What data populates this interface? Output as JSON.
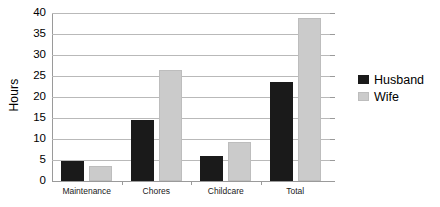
{
  "chart_data": {
    "type": "bar",
    "title": "",
    "xlabel": "",
    "ylabel": "Hours",
    "ylim": [
      0,
      40
    ],
    "yticks": [
      0,
      5,
      10,
      15,
      20,
      25,
      30,
      35,
      40
    ],
    "grid": true,
    "legend_position": "right",
    "categories": [
      "Maintenance",
      "Chores",
      "Childcare",
      "Total"
    ],
    "series": [
      {
        "name": "Husband",
        "color": "#1a1a1a",
        "values": [
          4.7,
          14.6,
          6.0,
          23.5
        ]
      },
      {
        "name": "Wife",
        "color": "#cbcbcb",
        "values": [
          3.6,
          26.4,
          9.3,
          38.7
        ]
      }
    ]
  }
}
